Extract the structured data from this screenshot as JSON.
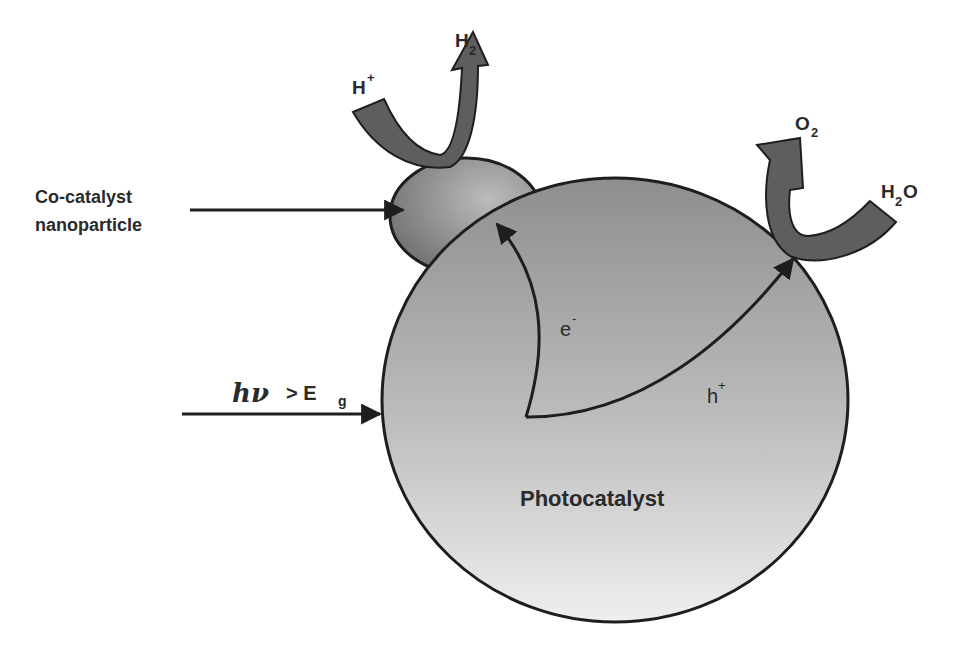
{
  "diagram": {
    "labels": {
      "cocatalyst_line1": "Co-catalyst",
      "cocatalyst_line2": "nanoparticle",
      "photon": "hν",
      "photon_condition": "> E",
      "photon_condition_sub": "g",
      "photocatalyst": "Photocatalyst",
      "electron": "e",
      "electron_sup": "-",
      "hole": "h",
      "hole_sup": "+",
      "proton": "H",
      "proton_sup": "+",
      "hydrogen": "H",
      "hydrogen_sub": "2",
      "oxygen": "O",
      "oxygen_sub": "2",
      "water_h": "H",
      "water_sub": "2",
      "water_o": "O"
    },
    "colors": {
      "particle_top": "#8e8e8e",
      "particle_bottom": "#ededed",
      "cocatalyst_dark": "#6a6a6a",
      "cocatalyst_light": "#b8b8b8",
      "reaction_arrow": "#5e5e5e",
      "outline": "#1e1e1e",
      "text": "#2a2a2a"
    }
  }
}
